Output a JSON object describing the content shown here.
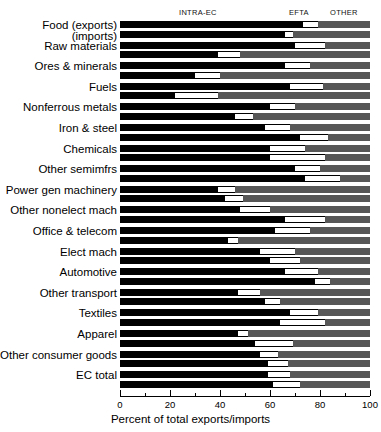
{
  "chart_data": {
    "type": "bar",
    "orientation": "horizontal",
    "stacked": true,
    "title": "",
    "xlabel": "Percent of total exports/imports",
    "ylabel": "",
    "xlim": [
      0,
      100
    ],
    "xticks": [
      0,
      20,
      40,
      60,
      80,
      100
    ],
    "xtick_labels": [
      "0",
      "20",
      "40",
      "60",
      "80",
      "100"
    ],
    "minor_ticks": [
      10,
      30,
      50,
      70,
      90
    ],
    "grid": false,
    "legend_position": "top",
    "legend": [
      {
        "name": "INTRA-EC",
        "color": "#000000"
      },
      {
        "name": "EFTA",
        "color": "#ffffff"
      },
      {
        "name": "OTHER",
        "color": "#575757"
      }
    ],
    "series": [
      {
        "name": "INTRA-EC",
        "color": "#000000"
      },
      {
        "name": "EFTA",
        "color": "#ffffff"
      },
      {
        "name": "OTHER",
        "color": "#575757"
      }
    ],
    "categories": [
      "Food (exports)",
      "Raw materials",
      "Ores & minerals",
      "Fuels",
      "Nonferrous metals",
      "Iron & steel",
      "Chemicals",
      "Other semimfrs",
      "Power gen machinery",
      "Other nonelect mach",
      "Office & telecom",
      "Elect mach",
      "Automotive",
      "Other transport",
      "Textiles",
      "Apparel",
      "Other consumer goods",
      "EC total"
    ],
    "first_category_sublabel": "(imports)",
    "rows": [
      {
        "category": "Food (exports)",
        "flow": "exports",
        "intra_ec": 73,
        "efta": 6,
        "other": 21
      },
      {
        "category": "Food (exports)",
        "flow": "imports",
        "intra_ec": 66,
        "efta": 3,
        "other": 31
      },
      {
        "category": "Raw materials",
        "flow": "exports",
        "intra_ec": 70,
        "efta": 12,
        "other": 18
      },
      {
        "category": "Raw materials",
        "flow": "imports",
        "intra_ec": 39,
        "efta": 9,
        "other": 52
      },
      {
        "category": "Ores & minerals",
        "flow": "exports",
        "intra_ec": 66,
        "efta": 10,
        "other": 24
      },
      {
        "category": "Ores & minerals",
        "flow": "imports",
        "intra_ec": 30,
        "efta": 10,
        "other": 60
      },
      {
        "category": "Fuels",
        "flow": "exports",
        "intra_ec": 68,
        "efta": 13,
        "other": 19
      },
      {
        "category": "Fuels",
        "flow": "imports",
        "intra_ec": 22,
        "efta": 17,
        "other": 61
      },
      {
        "category": "Nonferrous metals",
        "flow": "exports",
        "intra_ec": 60,
        "efta": 10,
        "other": 30
      },
      {
        "category": "Nonferrous metals",
        "flow": "imports",
        "intra_ec": 46,
        "efta": 7,
        "other": 47
      },
      {
        "category": "Iron & steel",
        "flow": "exports",
        "intra_ec": 58,
        "efta": 10,
        "other": 32
      },
      {
        "category": "Iron & steel",
        "flow": "imports",
        "intra_ec": 72,
        "efta": 11,
        "other": 17
      },
      {
        "category": "Chemicals",
        "flow": "exports",
        "intra_ec": 60,
        "efta": 14,
        "other": 26
      },
      {
        "category": "Chemicals",
        "flow": "imports",
        "intra_ec": 60,
        "efta": 22,
        "other": 18
      },
      {
        "category": "Other semimfrs",
        "flow": "exports",
        "intra_ec": 70,
        "efta": 10,
        "other": 20
      },
      {
        "category": "Other semimfrs",
        "flow": "imports",
        "intra_ec": 74,
        "efta": 14,
        "other": 12
      },
      {
        "category": "Power gen machinery",
        "flow": "exports",
        "intra_ec": 39,
        "efta": 7,
        "other": 54
      },
      {
        "category": "Power gen machinery",
        "flow": "imports",
        "intra_ec": 42,
        "efta": 7,
        "other": 51
      },
      {
        "category": "Other nonelect mach",
        "flow": "exports",
        "intra_ec": 48,
        "efta": 12,
        "other": 40
      },
      {
        "category": "Other nonelect mach",
        "flow": "imports",
        "intra_ec": 66,
        "efta": 16,
        "other": 18
      },
      {
        "category": "Office & telecom",
        "flow": "exports",
        "intra_ec": 62,
        "efta": 14,
        "other": 24
      },
      {
        "category": "Office & telecom",
        "flow": "imports",
        "intra_ec": 43,
        "efta": 4,
        "other": 53
      },
      {
        "category": "Elect mach",
        "flow": "exports",
        "intra_ec": 56,
        "efta": 14,
        "other": 30
      },
      {
        "category": "Elect mach",
        "flow": "imports",
        "intra_ec": 60,
        "efta": 12,
        "other": 28
      },
      {
        "category": "Automotive",
        "flow": "exports",
        "intra_ec": 66,
        "efta": 13,
        "other": 21
      },
      {
        "category": "Automotive",
        "flow": "imports",
        "intra_ec": 78,
        "efta": 6,
        "other": 16
      },
      {
        "category": "Other transport",
        "flow": "exports",
        "intra_ec": 47,
        "efta": 9,
        "other": 44
      },
      {
        "category": "Other transport",
        "flow": "imports",
        "intra_ec": 58,
        "efta": 6,
        "other": 36
      },
      {
        "category": "Textiles",
        "flow": "exports",
        "intra_ec": 68,
        "efta": 11,
        "other": 21
      },
      {
        "category": "Textiles",
        "flow": "imports",
        "intra_ec": 64,
        "efta": 18,
        "other": 18
      },
      {
        "category": "Apparel",
        "flow": "exports",
        "intra_ec": 47,
        "efta": 4,
        "other": 49
      },
      {
        "category": "Apparel",
        "flow": "imports",
        "intra_ec": 54,
        "efta": 15,
        "other": 31
      },
      {
        "category": "Other consumer goods",
        "flow": "exports",
        "intra_ec": 56,
        "efta": 7,
        "other": 37
      },
      {
        "category": "Other consumer goods",
        "flow": "imports",
        "intra_ec": 59,
        "efta": 8,
        "other": 33
      },
      {
        "category": "EC total",
        "flow": "exports",
        "intra_ec": 59,
        "efta": 9,
        "other": 32
      },
      {
        "category": "EC total",
        "flow": "imports",
        "intra_ec": 61,
        "efta": 11,
        "other": 28
      }
    ]
  }
}
